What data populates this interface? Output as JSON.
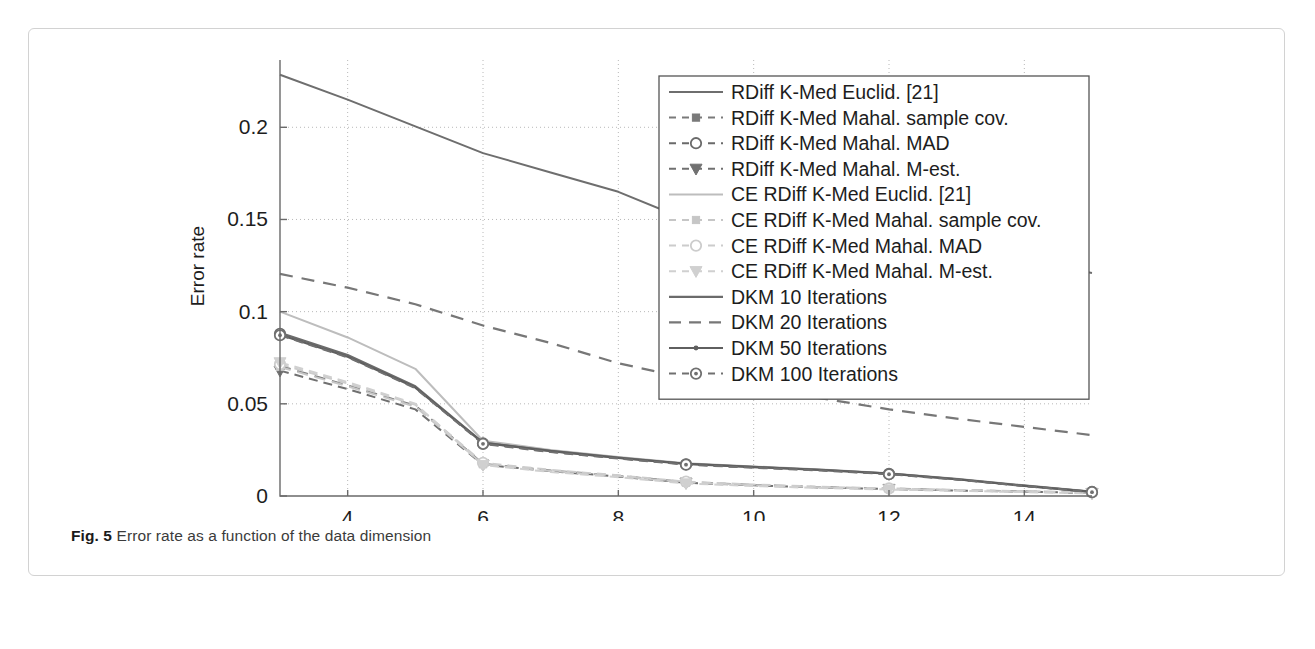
{
  "figure": {
    "caption_label": "Fig. 5",
    "caption_text": "Error rate as a function of the data dimension"
  },
  "chart_data": {
    "type": "line",
    "title": "",
    "xlabel": "Dimension of data",
    "ylabel": "Error rate",
    "x": [
      3,
      4,
      5,
      6,
      7,
      8,
      9,
      10,
      11,
      12,
      13,
      14,
      15
    ],
    "xlim": [
      3,
      15
    ],
    "ylim": [
      0,
      0.2365
    ],
    "xticks": [
      4,
      6,
      8,
      10,
      12,
      14
    ],
    "xtick_labels": [
      "4",
      "6",
      "8",
      "10",
      "12",
      "14"
    ],
    "yticks": [
      0,
      0.05,
      0.1,
      0.15,
      0.2
    ],
    "ytick_labels": [
      "0",
      "0.05",
      "0.1",
      "0.15",
      "0.2"
    ],
    "grid": true,
    "grid_style": "dotted",
    "legend_position": "top-right",
    "series": [
      {
        "name": "RDiff K-Med Euclid. [21]",
        "color": "#6e6e6e",
        "dash": "none",
        "marker": "none",
        "width": 2.0,
        "values": [
          0.2285,
          0.215,
          0.2005,
          0.186,
          0.1755,
          0.165,
          0.15,
          0.145,
          0.1395,
          0.1385,
          0.134,
          0.128,
          0.121
        ]
      },
      {
        "name": "RDiff K-Med Mahal. sample cov.",
        "color": "#7a7a7a",
        "dash": "dashed-dot-square",
        "marker": "square",
        "width": 2.0,
        "values": [
          0.0705,
          0.06,
          0.049,
          0.0175,
          0.0138,
          0.011,
          0.0075,
          0.006,
          0.0048,
          0.004,
          0.0032,
          0.0025,
          0.0018
        ]
      },
      {
        "name": "RDiff K-Med Mahal. MAD",
        "color": "#6a6a6a",
        "dash": "dashdot",
        "marker": "circle",
        "width": 2.0,
        "values": [
          0.088,
          0.076,
          0.059,
          0.0285,
          0.024,
          0.0205,
          0.0172,
          0.0155,
          0.014,
          0.012,
          0.009,
          0.0055,
          0.0022
        ]
      },
      {
        "name": "RDiff K-Med Mahal. M-est.",
        "color": "#707070",
        "dash": "dashdot",
        "marker": "triangle-down",
        "width": 2.0,
        "values": [
          0.068,
          0.058,
          0.047,
          0.017,
          0.0135,
          0.0105,
          0.0072,
          0.0058,
          0.0046,
          0.0038,
          0.003,
          0.0024,
          0.0016
        ]
      },
      {
        "name": "CE RDiff K-Med Euclid. [21]",
        "color": "#bdbdbd",
        "dash": "none",
        "marker": "none",
        "width": 2.0,
        "values": [
          0.1,
          0.086,
          0.069,
          0.03,
          0.025,
          0.0212,
          0.0178,
          0.016,
          0.0144,
          0.0124,
          0.0094,
          0.0058,
          0.0024
        ]
      },
      {
        "name": "CE RDiff K-Med Mahal. sample cov.",
        "color": "#c6c6c6",
        "dash": "dashed-dot-square",
        "marker": "square",
        "width": 2.0,
        "values": [
          0.07,
          0.0595,
          0.0485,
          0.0172,
          0.0136,
          0.0108,
          0.0074,
          0.0059,
          0.0047,
          0.0039,
          0.0031,
          0.0024,
          0.0017
        ]
      },
      {
        "name": "CE RDiff K-Med Mahal. MAD",
        "color": "#cccccc",
        "dash": "dashdot",
        "marker": "circle",
        "width": 2.0,
        "values": [
          0.0715,
          0.061,
          0.0495,
          0.018,
          0.0142,
          0.0112,
          0.0078,
          0.0062,
          0.005,
          0.0041,
          0.0033,
          0.0026,
          0.0019
        ]
      },
      {
        "name": "CE RDiff K-Med Mahal. M-est.",
        "color": "#d0d0d0",
        "dash": "dashdot",
        "marker": "triangle-down",
        "width": 2.0,
        "values": [
          0.0725,
          0.0618,
          0.05,
          0.0168,
          0.013,
          0.0102,
          0.0068,
          0.0054,
          0.0043,
          0.0035,
          0.0028,
          0.0021,
          0.0014
        ]
      },
      {
        "name": "DKM 10 Iterations",
        "color": "#6b6b6b",
        "dash": "none",
        "marker": "none",
        "width": 2.2,
        "values": [
          0.0885,
          0.0765,
          0.0595,
          0.029,
          0.0245,
          0.0208,
          0.0175,
          0.0158,
          0.0142,
          0.0122,
          0.0092,
          0.0056,
          0.0023
        ]
      },
      {
        "name": "DKM 20 Iterations",
        "color": "#777777",
        "dash": "dashed",
        "marker": "none",
        "width": 2.2,
        "values": [
          0.1205,
          0.113,
          0.104,
          0.0925,
          0.083,
          0.072,
          0.064,
          0.0585,
          0.053,
          0.047,
          0.042,
          0.0375,
          0.033
        ]
      },
      {
        "name": "DKM 50 Iterations",
        "color": "#5f5f5f",
        "dash": "none",
        "marker": "dot",
        "width": 2.2,
        "values": [
          0.0875,
          0.0755,
          0.0588,
          0.0288,
          0.0243,
          0.0206,
          0.0174,
          0.0157,
          0.0141,
          0.0121,
          0.0091,
          0.0055,
          0.0022
        ]
      },
      {
        "name": "DKM 100 Iterations",
        "color": "#707070",
        "dash": "dashdot",
        "marker": "circle-dot",
        "width": 2.0,
        "values": [
          0.0872,
          0.0752,
          0.0585,
          0.0283,
          0.0238,
          0.0203,
          0.017,
          0.0153,
          0.0138,
          0.0118,
          0.0089,
          0.0054,
          0.0021
        ]
      }
    ]
  }
}
